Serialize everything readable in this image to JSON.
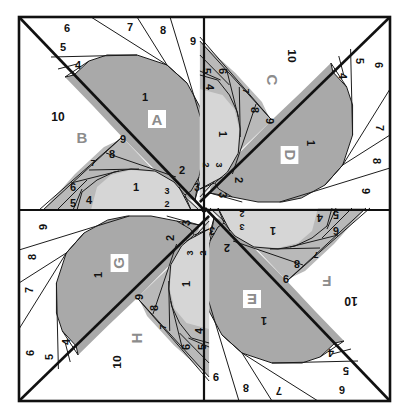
{
  "diagram": {
    "colors": {
      "dark": "#a9a9a9",
      "medium": "#b9b9b9",
      "light": "#d6d6d6",
      "white": "#ffffff",
      "line": "#111111",
      "label_text": "#8c8c8c"
    },
    "units": [
      {
        "id": "A",
        "label": "A",
        "quadrant": "top-left",
        "pieces": [
          "1",
          "2",
          "3",
          "4",
          "5",
          "6",
          "7",
          "8",
          "9"
        ]
      },
      {
        "id": "B",
        "label": "B",
        "quadrant": "top-left",
        "pieces": [
          "1",
          "2",
          "3",
          "4",
          "5",
          "6",
          "7",
          "8",
          "9",
          "10"
        ]
      },
      {
        "id": "C",
        "label": "C",
        "quadrant": "top-right",
        "pieces": [
          "1",
          "2",
          "3",
          "4",
          "5",
          "6",
          "7",
          "8",
          "9",
          "10"
        ]
      },
      {
        "id": "D",
        "label": "D",
        "quadrant": "top-right",
        "pieces": [
          "1",
          "2",
          "3",
          "4",
          "5",
          "6",
          "7",
          "8",
          "9"
        ]
      },
      {
        "id": "E",
        "label": "E",
        "quadrant": "bottom-right",
        "pieces": [
          "1",
          "2",
          "3",
          "4",
          "5",
          "6",
          "7",
          "8",
          "9"
        ]
      },
      {
        "id": "F",
        "label": "F",
        "quadrant": "bottom-right",
        "pieces": [
          "1",
          "2",
          "3",
          "4",
          "5",
          "6",
          "7",
          "8",
          "9",
          "10"
        ]
      },
      {
        "id": "G",
        "label": "G",
        "quadrant": "bottom-left",
        "pieces": [
          "1",
          "2",
          "3",
          "4",
          "5",
          "6",
          "7",
          "8",
          "9"
        ]
      },
      {
        "id": "H",
        "label": "H",
        "quadrant": "bottom-left",
        "pieces": [
          "1",
          "2",
          "3",
          "4",
          "5",
          "6",
          "7",
          "8",
          "9",
          "10"
        ]
      }
    ],
    "quadrants": [
      {
        "name": "top-left",
        "unitA": "A",
        "unitB": "B",
        "rotation": 0
      },
      {
        "name": "top-right",
        "unitA": "D",
        "unitB": "C",
        "rotation": 90
      },
      {
        "name": "bottom-right",
        "unitA": "E",
        "unitB": "F",
        "rotation": 180
      },
      {
        "name": "bottom-left",
        "unitA": "G",
        "unitB": "H",
        "rotation": 270
      }
    ],
    "piece_labels": {
      "a1": "1",
      "a2": "2",
      "a3": "3",
      "a4": "4",
      "a5": "5",
      "a6": "6",
      "a7": "7",
      "a8": "8",
      "a9": "9",
      "b1": "1",
      "b2": "2",
      "b3": "3",
      "b4": "4",
      "b5": "5",
      "b6": "6",
      "b7": "7",
      "b8": "8",
      "b9": "9",
      "b10": "10"
    }
  }
}
